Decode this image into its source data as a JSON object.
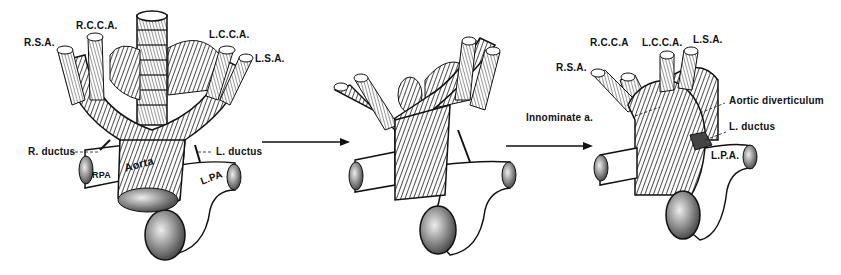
{
  "figure": {
    "panels": [
      {
        "id": "panel-1",
        "labels": {
          "rsa": "R.S.A.",
          "rcca": "R.C.C.A.",
          "lcca": "L.C.C.A.",
          "lsa": "L.S.A.",
          "r_ductus": "R. ductus",
          "l_ductus": "L. ductus",
          "aorta": "Aorta",
          "rpa": "RPA",
          "lpa": "L.PA"
        }
      },
      {
        "id": "panel-2",
        "labels": {}
      },
      {
        "id": "panel-3",
        "labels": {
          "rsa": "R.S.A.",
          "rcca": "R.C.C.A",
          "lcca": "L.C.C.A.",
          "lsa": "L.S.A.",
          "innominate": "Innominate a.",
          "aortic_diverticulum": "Aortic diverticulum",
          "l_ductus": "L. ductus",
          "lpa": "L.P.A."
        }
      }
    ],
    "arrows": [
      "panel-1-to-panel-2",
      "panel-2-to-panel-3"
    ],
    "colors": {
      "ink": "#111111",
      "background": "#ffffff"
    }
  }
}
